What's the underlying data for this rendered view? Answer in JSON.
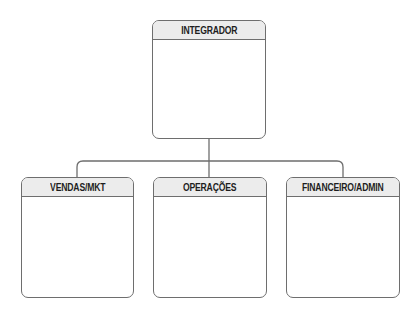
{
  "diagram": {
    "type": "org-chart",
    "root": {
      "label": "INTEGRADOR"
    },
    "children": [
      {
        "label": "VENDAS/MKT"
      },
      {
        "label": "OPERAÇÕES"
      },
      {
        "label": "FINANCEIRO/ADMIN"
      }
    ]
  }
}
